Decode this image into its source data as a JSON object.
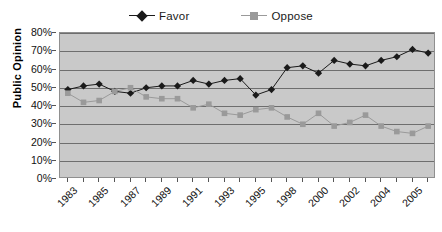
{
  "legend": {
    "position": "top-center",
    "entries": [
      {
        "label": "Favor",
        "color": "#1a1a1a",
        "marker": "diamond",
        "icon": "diamond-marker-icon"
      },
      {
        "label": "Oppose",
        "color": "#9a9a9a",
        "marker": "square",
        "icon": "square-marker-icon"
      }
    ]
  },
  "axes": {
    "ylabel": "Public Opinion",
    "xlabel": "",
    "yticks": [
      "0%",
      "10%",
      "20%",
      "30%",
      "40%",
      "50%",
      "60%",
      "70%",
      "80%"
    ]
  },
  "colors": {
    "favor": "#1a1a1a",
    "oppose": "#9a9a9a",
    "plot_background": "#c9c9c9",
    "gridline": "#6e6e6e",
    "plot_border": "#8f8f8f",
    "page_background": "#ffffff"
  },
  "chart_data": {
    "type": "line",
    "title": "",
    "xlabel": "",
    "ylabel": "Public Opinion",
    "ylim": [
      0,
      80
    ],
    "ytick_values": [
      0,
      10,
      20,
      30,
      40,
      50,
      60,
      70,
      80
    ],
    "ytick_labels": [
      "0%",
      "10%",
      "20%",
      "30%",
      "40%",
      "50%",
      "60%",
      "70%",
      "80%"
    ],
    "grid": true,
    "legend_position": "top-center",
    "x": [
      "1983",
      "1984",
      "1985",
      "1986",
      "1987",
      "1988",
      "1989",
      "1990",
      "1991",
      "1992",
      "1993",
      "1994",
      "1995",
      "1996",
      "1997",
      "1998",
      "1999",
      "2000",
      "2001",
      "2002",
      "2003",
      "2004",
      "2005",
      "2006"
    ],
    "xtick_labels_shown": [
      "1983",
      "",
      "1985",
      "",
      "1987",
      "",
      "1989",
      "",
      "1991",
      "",
      "1993",
      "",
      "1995",
      "",
      "1998",
      "",
      "2000",
      "",
      "2002",
      "",
      "2004",
      "",
      "2005",
      ""
    ],
    "series": [
      {
        "name": "Favor",
        "color": "#1a1a1a",
        "marker": "diamond",
        "values": [
          49,
          51,
          52,
          48,
          47,
          50,
          51,
          51,
          54,
          52,
          54,
          55,
          46,
          49,
          61,
          62,
          58,
          65,
          63,
          62,
          65,
          67,
          71,
          69
        ]
      },
      {
        "name": "Oppose",
        "color": "#9a9a9a",
        "marker": "square",
        "values": [
          47,
          42,
          43,
          48,
          50,
          45,
          44,
          44,
          39,
          41,
          36,
          35,
          38,
          39,
          34,
          30,
          36,
          29,
          31,
          35,
          29,
          26,
          25,
          29
        ]
      }
    ]
  }
}
